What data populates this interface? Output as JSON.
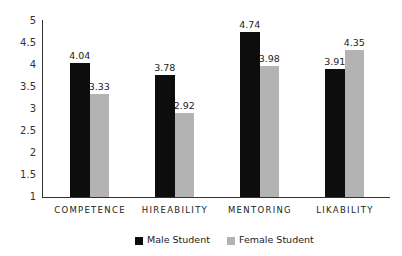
{
  "chart_data": {
    "type": "bar",
    "title": "",
    "xlabel": "",
    "ylabel": "",
    "ylim": [
      1,
      5
    ],
    "yticks": [
      "5",
      "4.5",
      "4",
      "3.5",
      "3",
      "2.5",
      "2",
      "1.5",
      "1"
    ],
    "grid": false,
    "legend_position": "bottom",
    "categories": [
      "COMPETENCE",
      "HIREABILITY",
      "MENTORING",
      "LIKABILITY"
    ],
    "series": [
      {
        "name": "Male Student",
        "color": "#0d0d0d",
        "values": [
          4.04,
          3.78,
          4.74,
          3.91
        ],
        "labels": [
          "4.04",
          "3.78",
          "4.74",
          "3.91"
        ]
      },
      {
        "name": "Female Student",
        "color": "#b3b3b3",
        "values": [
          3.33,
          2.92,
          3.98,
          4.35
        ],
        "labels": [
          "3.33",
          "2.92",
          "3.98",
          "4.35"
        ]
      }
    ]
  }
}
